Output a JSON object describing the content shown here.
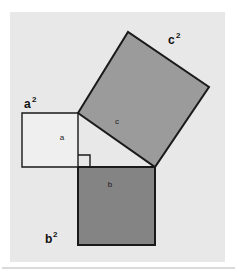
{
  "figure": {
    "panel": {
      "background_color": "#e8e8e8",
      "page_color": "#ffffff",
      "x": 10,
      "y": 12,
      "width": 215,
      "height": 250
    },
    "divider": {
      "color": "#b5b5b5",
      "y": 268,
      "x1": 2,
      "x2": 235
    },
    "squares": [
      {
        "id": "square-a",
        "outer_label": "a",
        "outer_exponent": "2",
        "inner_label": "a",
        "fill_color": "#efefef",
        "stroke_color": "#1a1a1a",
        "stroke_width": 1.4,
        "points": "22,113 78,113 78,167 22,167",
        "inner_label_x": 62,
        "inner_label_y": 140,
        "outer_label_x": 24,
        "outer_label_y": 108
      },
      {
        "id": "square-b",
        "outer_label": "b",
        "outer_exponent": "2",
        "inner_label": "b",
        "fill_color": "#848484",
        "stroke_color": "#1a1a1a",
        "stroke_width": 2.0,
        "points": "78,167 155,167 155,245 78,245",
        "inner_label_x": 110,
        "inner_label_y": 187,
        "outer_label_x": 45,
        "outer_label_y": 243
      },
      {
        "id": "square-c",
        "outer_label": "c",
        "outer_exponent": "2",
        "inner_label": "c",
        "fill_color": "#9b9b9b",
        "stroke_color": "#1a1a1a",
        "stroke_width": 2.0,
        "points": "78,113 128,32 209,87 155,167",
        "inner_label_x": 117,
        "inner_label_y": 124,
        "outer_label_x": 168,
        "outer_label_y": 44
      }
    ],
    "right_angle_marker": {
      "id": "right-angle-marker",
      "stroke_color": "#1a1a1a",
      "stroke_width": 1.4,
      "path": "M 78 155 L 90 155 L 90 167"
    },
    "triangle": {
      "id": "right-triangle",
      "vertices": "78,113 78,167 155,167",
      "stroke_color": "#1a1a1a"
    }
  }
}
